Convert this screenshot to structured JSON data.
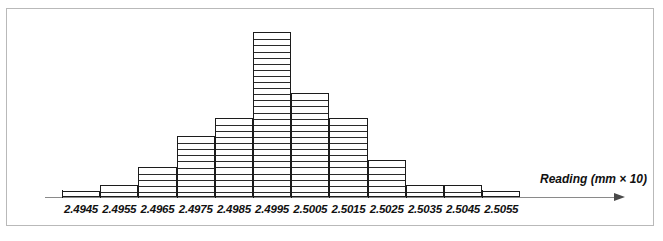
{
  "figure": {
    "kind": "histogram-figure",
    "frame_border_color": "#b9b9b9",
    "axis_color": "#8a8a8a",
    "bar_outline_color": "#1c1c1c",
    "bar_fill_color": "#ffffff",
    "segment_line_color": "#2a2a2a",
    "axis_title": "Reading (mm × 10)",
    "arrow_icon": "right-arrow-icon"
  },
  "chart_data": {
    "type": "bar",
    "title": "",
    "subtitle": "",
    "xlabel": "Reading (mm × 10)",
    "ylabel": "",
    "grid": false,
    "legend": [],
    "legend_position": "none",
    "note": "Stacked-unit histogram: each horizontal division inside a bar represents one observation.",
    "unit_per_division": 1,
    "categories": [
      "2.4945",
      "2.4955",
      "2.4965",
      "2.4975",
      "2.4985",
      "2.4995",
      "2.5005",
      "2.5015",
      "2.5025",
      "2.5035",
      "2.5045",
      "2.5055"
    ],
    "values": [
      1,
      2,
      5,
      10,
      13,
      27,
      17,
      13,
      6,
      2,
      2,
      1
    ],
    "ylim": [
      0,
      28
    ],
    "xlim": [
      "2.4940",
      "2.5060"
    ],
    "tick_labels": [
      "2.4945",
      "2.4955",
      "2.4965",
      "2.4975",
      "2.4985",
      "2.4995",
      "2.5005",
      "2.5015",
      "2.5025",
      "2.5035",
      "2.5045",
      "2.5055"
    ]
  }
}
